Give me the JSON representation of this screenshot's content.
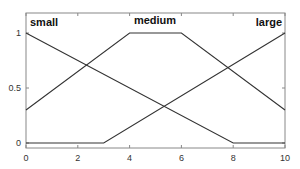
{
  "chart_data": {
    "type": "line",
    "title": "",
    "xlabel": "",
    "ylabel": "",
    "xlim": [
      0,
      10
    ],
    "ylim": [
      0,
      1
    ],
    "xticks": [
      0,
      2,
      4,
      6,
      8,
      10
    ],
    "yticks": [
      0,
      0.5,
      1
    ],
    "xtick_labels": [
      "0",
      "2",
      "4",
      "6",
      "8",
      "10"
    ],
    "ytick_labels": [
      "0",
      "0.5",
      "1"
    ],
    "grid": false,
    "legend": null,
    "series": [
      {
        "name": "small",
        "x": [
          0,
          8,
          10
        ],
        "y": [
          1,
          0,
          0
        ]
      },
      {
        "name": "medium",
        "x": [
          0,
          4,
          6,
          10
        ],
        "y": [
          0.3,
          1,
          1,
          0.3
        ]
      },
      {
        "name": "large",
        "x": [
          0,
          3,
          10
        ],
        "y": [
          0,
          0,
          1
        ]
      }
    ],
    "annotations": [
      {
        "text": "small",
        "x": 0.3,
        "y": 1.12
      },
      {
        "text": "medium",
        "x": 5.0,
        "y": 1.12
      },
      {
        "text": "large",
        "x": 9.4,
        "y": 1.12
      }
    ],
    "line_color": "#333333",
    "axes_color": "#555555"
  }
}
